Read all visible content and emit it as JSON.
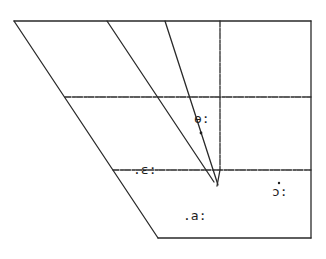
{
  "diagram": {
    "type": "vowel-quadrilateral",
    "line_color": "#2a2a2a",
    "text_color": "#1e1e1e",
    "vowels": [
      {
        "symbol": "ɵ:",
        "row": "close-mid",
        "position": "central"
      },
      {
        "symbol": "ɛ:",
        "row": "open-mid",
        "position": "front"
      },
      {
        "symbol": "ɔ:",
        "row": "open",
        "position": "back"
      },
      {
        "symbol": "a:",
        "row": "open",
        "position": "central"
      }
    ],
    "labels": {
      "v1": "ɵ:",
      "v2": ".ɛ:",
      "v3": "ɔ:",
      "v4": ".a:"
    }
  }
}
